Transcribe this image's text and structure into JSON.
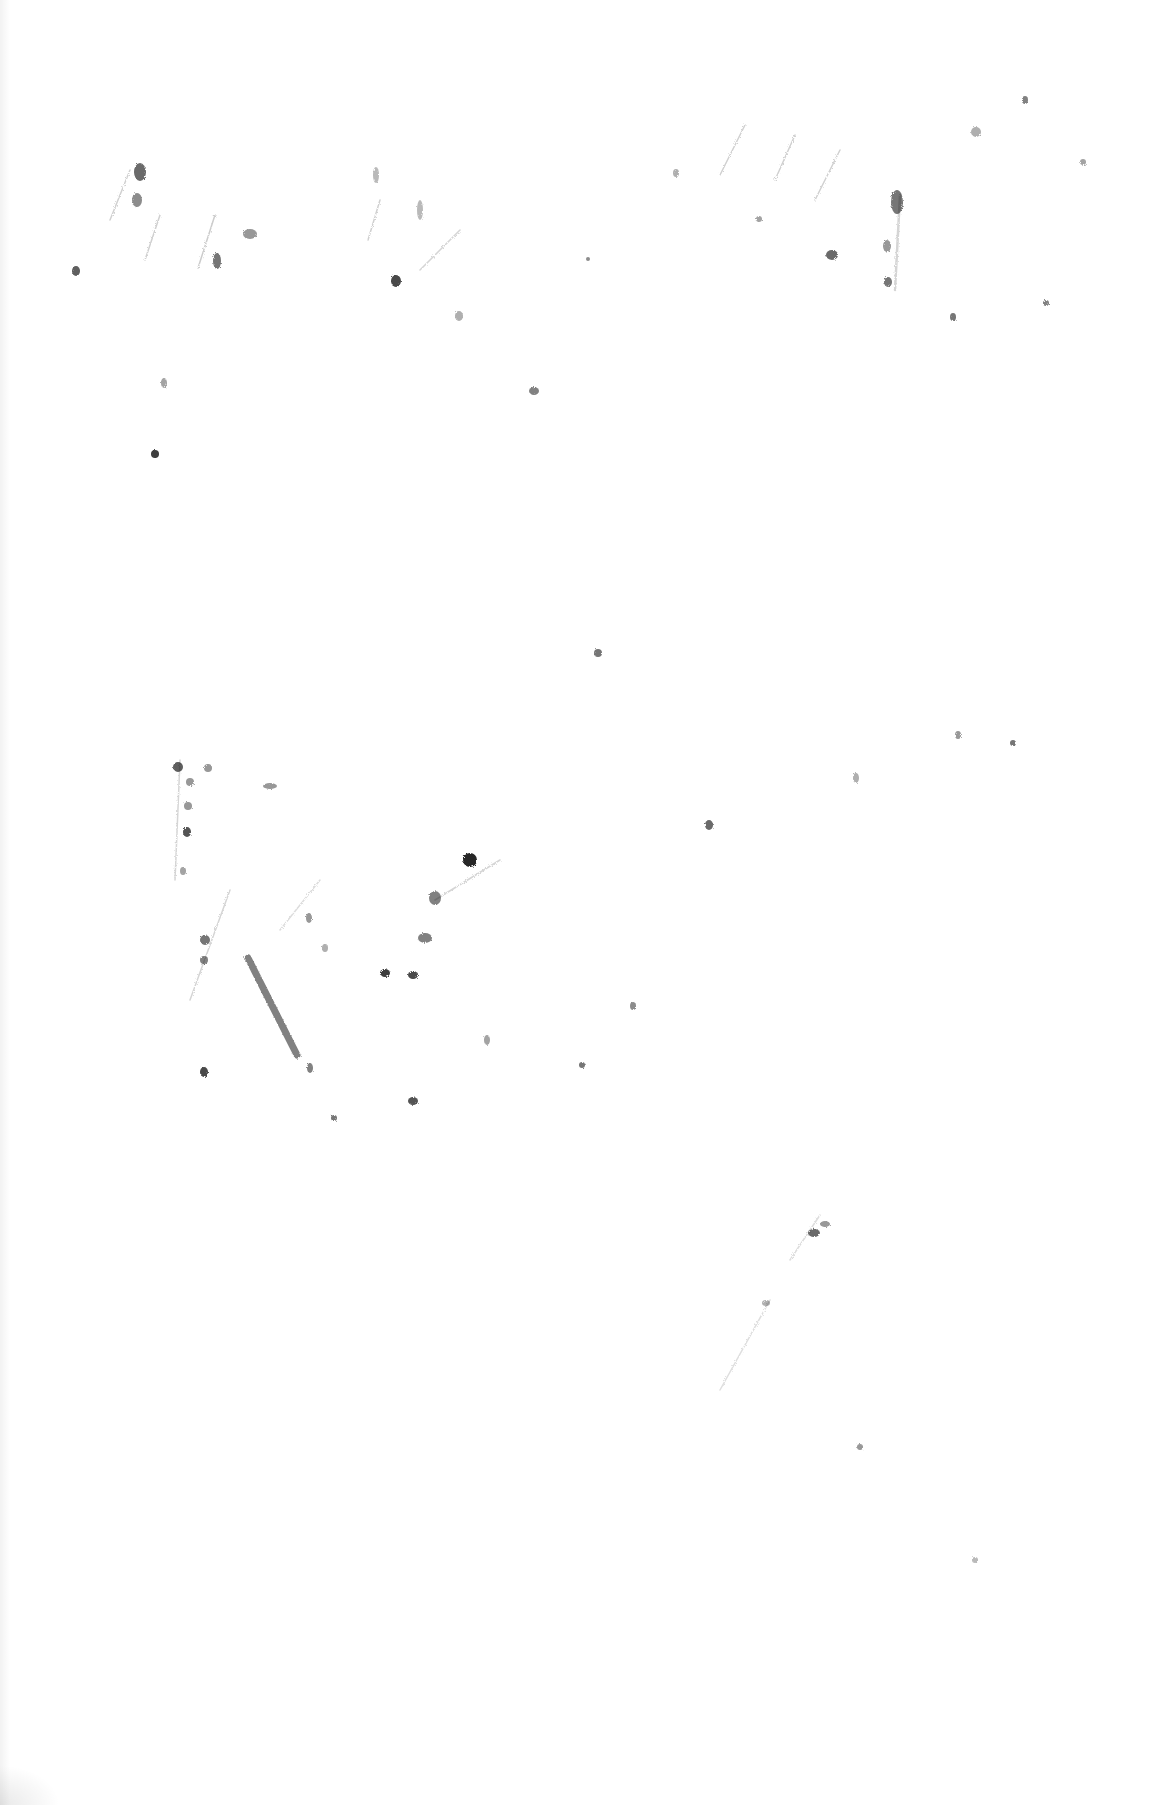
{
  "page": {
    "description": "Scanned sheet of paper, mostly blank, with faint illegible pencil/charcoal smudges and erased handwriting traces",
    "background": "#ffffff",
    "mark_color": "#1a1a1a",
    "legible_text": ""
  },
  "marks": [
    {
      "x": 140,
      "y": 172,
      "rx": 6,
      "ry": 9,
      "opacity": 0.65
    },
    {
      "x": 137,
      "y": 200,
      "rx": 5,
      "ry": 7,
      "opacity": 0.5
    },
    {
      "x": 76,
      "y": 271,
      "rx": 4,
      "ry": 5,
      "opacity": 0.7
    },
    {
      "x": 217,
      "y": 261,
      "rx": 4,
      "ry": 8,
      "opacity": 0.6
    },
    {
      "x": 250,
      "y": 234,
      "rx": 7,
      "ry": 5,
      "opacity": 0.45
    },
    {
      "x": 396,
      "y": 281,
      "rx": 5,
      "ry": 6,
      "opacity": 0.8
    },
    {
      "x": 164,
      "y": 383,
      "rx": 3,
      "ry": 5,
      "opacity": 0.4
    },
    {
      "x": 155,
      "y": 454,
      "rx": 4,
      "ry": 4,
      "opacity": 0.85
    },
    {
      "x": 534,
      "y": 391,
      "rx": 5,
      "ry": 4,
      "opacity": 0.55
    },
    {
      "x": 459,
      "y": 316,
      "rx": 4,
      "ry": 5,
      "opacity": 0.35
    },
    {
      "x": 420,
      "y": 210,
      "rx": 3,
      "ry": 10,
      "opacity": 0.3
    },
    {
      "x": 376,
      "y": 175,
      "rx": 3,
      "ry": 8,
      "opacity": 0.3
    },
    {
      "x": 897,
      "y": 202,
      "rx": 6,
      "ry": 12,
      "opacity": 0.6
    },
    {
      "x": 832,
      "y": 255,
      "rx": 6,
      "ry": 5,
      "opacity": 0.65
    },
    {
      "x": 887,
      "y": 246,
      "rx": 4,
      "ry": 6,
      "opacity": 0.45
    },
    {
      "x": 888,
      "y": 282,
      "rx": 4,
      "ry": 5,
      "opacity": 0.6
    },
    {
      "x": 953,
      "y": 317,
      "rx": 3,
      "ry": 4,
      "opacity": 0.6
    },
    {
      "x": 1046,
      "y": 303,
      "rx": 3,
      "ry": 3,
      "opacity": 0.55
    },
    {
      "x": 1025,
      "y": 100,
      "rx": 3,
      "ry": 4,
      "opacity": 0.55
    },
    {
      "x": 976,
      "y": 132,
      "rx": 5,
      "ry": 5,
      "opacity": 0.35
    },
    {
      "x": 1083,
      "y": 162,
      "rx": 3,
      "ry": 3,
      "opacity": 0.4
    },
    {
      "x": 676,
      "y": 173,
      "rx": 3,
      "ry": 4,
      "opacity": 0.35
    },
    {
      "x": 759,
      "y": 219,
      "rx": 3,
      "ry": 3,
      "opacity": 0.4
    },
    {
      "x": 588,
      "y": 259,
      "rx": 2,
      "ry": 2,
      "opacity": 0.5
    },
    {
      "x": 598,
      "y": 653,
      "rx": 4,
      "ry": 4,
      "opacity": 0.6
    },
    {
      "x": 178,
      "y": 767,
      "rx": 5,
      "ry": 5,
      "opacity": 0.7
    },
    {
      "x": 190,
      "y": 782,
      "rx": 4,
      "ry": 4,
      "opacity": 0.45
    },
    {
      "x": 208,
      "y": 768,
      "rx": 4,
      "ry": 4,
      "opacity": 0.45
    },
    {
      "x": 188,
      "y": 806,
      "rx": 4,
      "ry": 4,
      "opacity": 0.45
    },
    {
      "x": 187,
      "y": 832,
      "rx": 4,
      "ry": 5,
      "opacity": 0.75
    },
    {
      "x": 183,
      "y": 871,
      "rx": 3,
      "ry": 4,
      "opacity": 0.4
    },
    {
      "x": 205,
      "y": 940,
      "rx": 5,
      "ry": 5,
      "opacity": 0.6
    },
    {
      "x": 204,
      "y": 960,
      "rx": 4,
      "ry": 4,
      "opacity": 0.55
    },
    {
      "x": 270,
      "y": 786,
      "rx": 7,
      "ry": 3,
      "opacity": 0.45
    },
    {
      "x": 470,
      "y": 860,
      "rx": 7,
      "ry": 7,
      "opacity": 0.95
    },
    {
      "x": 435,
      "y": 898,
      "rx": 6,
      "ry": 7,
      "opacity": 0.55
    },
    {
      "x": 425,
      "y": 938,
      "rx": 7,
      "ry": 5,
      "opacity": 0.55
    },
    {
      "x": 385,
      "y": 973,
      "rx": 5,
      "ry": 4,
      "opacity": 0.85
    },
    {
      "x": 413,
      "y": 975,
      "rx": 5,
      "ry": 4,
      "opacity": 0.8
    },
    {
      "x": 309,
      "y": 918,
      "rx": 3,
      "ry": 5,
      "opacity": 0.45
    },
    {
      "x": 325,
      "y": 948,
      "rx": 3,
      "ry": 4,
      "opacity": 0.35
    },
    {
      "x": 204,
      "y": 1072,
      "rx": 4,
      "ry": 5,
      "opacity": 0.8
    },
    {
      "x": 310,
      "y": 1068,
      "rx": 3,
      "ry": 5,
      "opacity": 0.55
    },
    {
      "x": 413,
      "y": 1101,
      "rx": 5,
      "ry": 4,
      "opacity": 0.75
    },
    {
      "x": 334,
      "y": 1118,
      "rx": 3,
      "ry": 3,
      "opacity": 0.6
    },
    {
      "x": 582,
      "y": 1065,
      "rx": 3,
      "ry": 3,
      "opacity": 0.6
    },
    {
      "x": 633,
      "y": 1006,
      "rx": 3,
      "ry": 4,
      "opacity": 0.5
    },
    {
      "x": 487,
      "y": 1040,
      "rx": 3,
      "ry": 5,
      "opacity": 0.4
    },
    {
      "x": 709,
      "y": 825,
      "rx": 4,
      "ry": 5,
      "opacity": 0.65
    },
    {
      "x": 958,
      "y": 735,
      "rx": 3,
      "ry": 4,
      "opacity": 0.45
    },
    {
      "x": 1013,
      "y": 743,
      "rx": 3,
      "ry": 3,
      "opacity": 0.6
    },
    {
      "x": 856,
      "y": 778,
      "rx": 3,
      "ry": 5,
      "opacity": 0.35
    },
    {
      "x": 814,
      "y": 1233,
      "rx": 6,
      "ry": 4,
      "opacity": 0.65
    },
    {
      "x": 825,
      "y": 1224,
      "rx": 5,
      "ry": 3,
      "opacity": 0.45
    },
    {
      "x": 766,
      "y": 1303,
      "rx": 4,
      "ry": 3,
      "opacity": 0.35
    },
    {
      "x": 860,
      "y": 1447,
      "rx": 3,
      "ry": 3,
      "opacity": 0.45
    },
    {
      "x": 975,
      "y": 1560,
      "rx": 3,
      "ry": 3,
      "opacity": 0.3
    }
  ],
  "strokes": [
    {
      "x1": 248,
      "y1": 958,
      "x2": 297,
      "y2": 1055,
      "width": 7,
      "opacity": 0.55
    },
    {
      "x1": 130,
      "y1": 170,
      "x2": 110,
      "y2": 220,
      "width": 1.5,
      "opacity": 0.2
    },
    {
      "x1": 160,
      "y1": 215,
      "x2": 145,
      "y2": 260,
      "width": 1.5,
      "opacity": 0.2
    },
    {
      "x1": 215,
      "y1": 215,
      "x2": 198,
      "y2": 268,
      "width": 1.5,
      "opacity": 0.22
    },
    {
      "x1": 380,
      "y1": 200,
      "x2": 368,
      "y2": 240,
      "width": 1.5,
      "opacity": 0.2
    },
    {
      "x1": 460,
      "y1": 230,
      "x2": 420,
      "y2": 270,
      "width": 1.5,
      "opacity": 0.18
    },
    {
      "x1": 745,
      "y1": 125,
      "x2": 720,
      "y2": 175,
      "width": 1.5,
      "opacity": 0.2
    },
    {
      "x1": 795,
      "y1": 135,
      "x2": 775,
      "y2": 180,
      "width": 1.5,
      "opacity": 0.2
    },
    {
      "x1": 840,
      "y1": 150,
      "x2": 815,
      "y2": 200,
      "width": 1.5,
      "opacity": 0.2
    },
    {
      "x1": 900,
      "y1": 195,
      "x2": 895,
      "y2": 290,
      "width": 2.5,
      "opacity": 0.18
    },
    {
      "x1": 180,
      "y1": 760,
      "x2": 175,
      "y2": 880,
      "width": 1.5,
      "opacity": 0.18
    },
    {
      "x1": 230,
      "y1": 890,
      "x2": 190,
      "y2": 1000,
      "width": 1.5,
      "opacity": 0.18
    },
    {
      "x1": 500,
      "y1": 860,
      "x2": 435,
      "y2": 900,
      "width": 1.5,
      "opacity": 0.18
    },
    {
      "x1": 320,
      "y1": 880,
      "x2": 280,
      "y2": 930,
      "width": 1.5,
      "opacity": 0.15
    },
    {
      "x1": 820,
      "y1": 1215,
      "x2": 790,
      "y2": 1260,
      "width": 1.5,
      "opacity": 0.15
    },
    {
      "x1": 770,
      "y1": 1300,
      "x2": 720,
      "y2": 1390,
      "width": 1.5,
      "opacity": 0.14
    }
  ]
}
